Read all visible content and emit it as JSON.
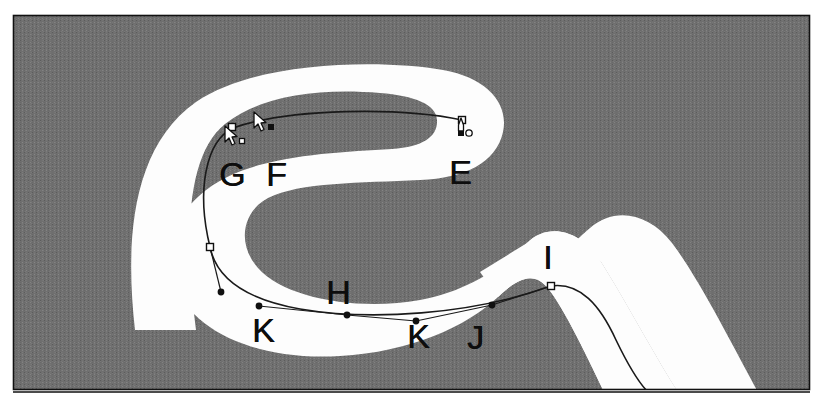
{
  "figure": {
    "width": 827,
    "height": 404,
    "background_color": "#ffffff",
    "canvas_color": "#6f6f6f",
    "band_color": "#fdfdfd",
    "path_stroke_color": "#1a1a1a",
    "border_color": "#111111"
  },
  "callouts": [
    {
      "id": "E",
      "label": "E",
      "x": 449,
      "y": 155
    },
    {
      "id": "F",
      "label": "F",
      "x": 266,
      "y": 157
    },
    {
      "id": "G",
      "label": "G",
      "x": 219,
      "y": 157
    },
    {
      "id": "H",
      "label": "H",
      "x": 326,
      "y": 275
    },
    {
      "id": "I",
      "label": "I",
      "x": 543,
      "y": 240
    },
    {
      "id": "J",
      "label": "J",
      "x": 467,
      "y": 320
    },
    {
      "id": "K1",
      "label": "K",
      "x": 252,
      "y": 313
    },
    {
      "id": "K2",
      "label": "K",
      "x": 407,
      "y": 319
    }
  ],
  "anchor_points": [
    {
      "id": "anchor-E",
      "x": 462,
      "y": 120,
      "kind": "hollow-square"
    },
    {
      "id": "anchor-G",
      "x": 233,
      "y": 128,
      "kind": "hollow-square"
    },
    {
      "id": "anchor-left-lower",
      "x": 210,
      "y": 247,
      "kind": "hollow-square"
    },
    {
      "id": "anchor-I",
      "x": 551,
      "y": 286,
      "kind": "hollow-square"
    }
  ],
  "control_handles": [
    {
      "id": "handle-left-lower",
      "x": 221,
      "y": 292,
      "kind": "filled-dot"
    },
    {
      "id": "handle-K1",
      "x": 259,
      "y": 306,
      "kind": "filled-dot"
    },
    {
      "id": "handle-K2-mid",
      "x": 347,
      "y": 315,
      "kind": "filled-dot"
    },
    {
      "id": "handle-J",
      "x": 416,
      "y": 321,
      "kind": "filled-dot"
    },
    {
      "id": "handle-I",
      "x": 492,
      "y": 305,
      "kind": "filled-dot"
    }
  ],
  "cursors": [
    {
      "id": "pen-cursor-F",
      "x": 262,
      "y": 118,
      "badge": "filled-square",
      "note": "pen tool with solid square badge"
    },
    {
      "id": "pen-cursor-G",
      "x": 232,
      "y": 132,
      "badge": "hollow-square",
      "note": "pen tool with hollow square badge"
    },
    {
      "id": "pen-cursor-E",
      "x": 462,
      "y": 124,
      "badge": "circle",
      "note": "pen tool close-path cursor with small circle"
    }
  ],
  "icons": {
    "pen_cursor": "pen-cursor-icon",
    "anchor_point": "anchor-point-icon",
    "control_handle": "control-handle-icon"
  }
}
